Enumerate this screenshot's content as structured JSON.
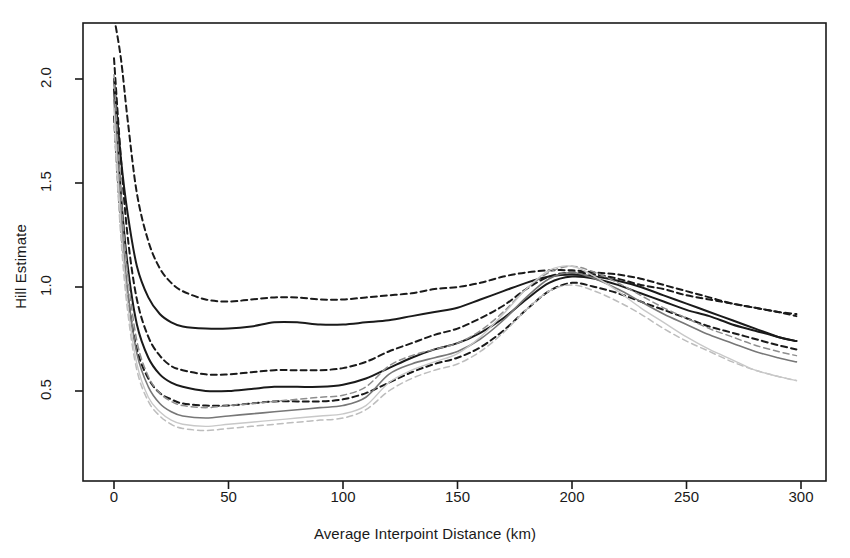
{
  "figure": {
    "top_title_fragment": "",
    "background": "#ffffff"
  },
  "axes": {
    "x_title": "Average Interpoint Distance (km)",
    "y_title": "Hill Estimate",
    "x_ticks": [
      "0",
      "50",
      "100",
      "150",
      "200",
      "250",
      "300"
    ],
    "y_ticks": [
      "0.5",
      "1.0",
      "1.5",
      "2.0"
    ],
    "frame_color": "#1a1a1a"
  },
  "colors": {
    "dark": "#1a1a1a",
    "mid": "#555555",
    "gray": "#a8a8a8",
    "light_gray": "#c0c0c0"
  },
  "chart_data": {
    "type": "line",
    "title": "",
    "xlabel": "Average Interpoint Distance (km)",
    "ylabel": "Hill Estimate",
    "xlim": [
      -5,
      305
    ],
    "ylim": [
      0.22,
      2.18
    ],
    "xticks": [
      0,
      50,
      100,
      150,
      200,
      250,
      300
    ],
    "yticks": [
      0.5,
      1.0,
      1.5,
      2.0
    ],
    "grid": false,
    "legend": "none",
    "x": [
      0,
      3,
      6,
      10,
      15,
      20,
      25,
      30,
      40,
      50,
      60,
      70,
      80,
      90,
      100,
      110,
      120,
      130,
      140,
      150,
      160,
      170,
      180,
      190,
      200,
      210,
      220,
      230,
      240,
      250,
      260,
      270,
      280,
      290,
      298
    ],
    "series": [
      {
        "name": "Estimate 1 (upper, solid, dark)",
        "style": "solid",
        "color": "#1a1a1a",
        "width": 2.0,
        "values": [
          2.0,
          1.62,
          1.35,
          1.1,
          0.95,
          0.87,
          0.83,
          0.81,
          0.8,
          0.8,
          0.81,
          0.83,
          0.83,
          0.82,
          0.82,
          0.83,
          0.84,
          0.86,
          0.88,
          0.9,
          0.94,
          0.98,
          1.02,
          1.05,
          1.06,
          1.05,
          1.03,
          1.0,
          0.96,
          0.92,
          0.88,
          0.84,
          0.8,
          0.76,
          0.74
        ]
      },
      {
        "name": "Estimate 1 upper CI (dashed, dark)",
        "style": "dashed",
        "color": "#1a1a1a",
        "width": 2.0,
        "values": [
          2.3,
          2.1,
          1.8,
          1.45,
          1.22,
          1.09,
          1.02,
          0.98,
          0.94,
          0.93,
          0.94,
          0.95,
          0.95,
          0.94,
          0.94,
          0.95,
          0.96,
          0.97,
          0.99,
          1.0,
          1.02,
          1.05,
          1.07,
          1.08,
          1.08,
          1.07,
          1.06,
          1.04,
          1.01,
          0.98,
          0.95,
          0.92,
          0.9,
          0.88,
          0.86
        ]
      },
      {
        "name": "Estimate 2 (middle, solid, dark)",
        "style": "solid",
        "color": "#1a1a1a",
        "width": 2.0,
        "values": [
          1.95,
          1.45,
          1.1,
          0.82,
          0.66,
          0.58,
          0.54,
          0.52,
          0.5,
          0.5,
          0.51,
          0.52,
          0.52,
          0.52,
          0.53,
          0.56,
          0.61,
          0.66,
          0.7,
          0.73,
          0.78,
          0.85,
          0.94,
          1.02,
          1.05,
          1.04,
          1.01,
          0.97,
          0.93,
          0.89,
          0.86,
          0.82,
          0.79,
          0.76,
          0.74
        ]
      },
      {
        "name": "Estimate 2 upper CI (dashed, dark)",
        "style": "dashed",
        "color": "#1a1a1a",
        "width": 2.0,
        "values": [
          2.1,
          1.62,
          1.24,
          0.94,
          0.76,
          0.67,
          0.62,
          0.6,
          0.58,
          0.58,
          0.59,
          0.6,
          0.6,
          0.6,
          0.61,
          0.64,
          0.69,
          0.73,
          0.77,
          0.8,
          0.85,
          0.91,
          0.99,
          1.05,
          1.07,
          1.06,
          1.04,
          1.01,
          0.99,
          0.96,
          0.94,
          0.92,
          0.9,
          0.88,
          0.87
        ]
      },
      {
        "name": "Estimate 2 lower CI (dashed, dark)",
        "style": "dashed",
        "color": "#1a1a1a",
        "width": 2.0,
        "values": [
          1.82,
          1.3,
          0.96,
          0.7,
          0.56,
          0.49,
          0.46,
          0.44,
          0.43,
          0.43,
          0.44,
          0.45,
          0.45,
          0.45,
          0.46,
          0.49,
          0.54,
          0.59,
          0.63,
          0.66,
          0.71,
          0.79,
          0.89,
          0.98,
          1.02,
          1.0,
          0.97,
          0.93,
          0.89,
          0.85,
          0.81,
          0.78,
          0.75,
          0.72,
          0.7
        ]
      },
      {
        "name": "Estimate 3 (lower, solid, gray)",
        "style": "solid",
        "color": "#777777",
        "width": 1.6,
        "values": [
          1.9,
          1.35,
          0.98,
          0.68,
          0.52,
          0.44,
          0.4,
          0.38,
          0.37,
          0.38,
          0.39,
          0.4,
          0.41,
          0.42,
          0.43,
          0.47,
          0.58,
          0.63,
          0.66,
          0.69,
          0.75,
          0.84,
          0.95,
          1.04,
          1.07,
          1.04,
          0.99,
          0.93,
          0.87,
          0.82,
          0.77,
          0.73,
          0.69,
          0.66,
          0.64
        ]
      },
      {
        "name": "Estimate 3 upper CI (dashed, gray)",
        "style": "dashed",
        "color": "#8e8e8e",
        "width": 1.5,
        "values": [
          2.02,
          1.45,
          1.06,
          0.74,
          0.57,
          0.49,
          0.45,
          0.43,
          0.42,
          0.43,
          0.44,
          0.45,
          0.46,
          0.47,
          0.48,
          0.52,
          0.62,
          0.67,
          0.7,
          0.73,
          0.79,
          0.88,
          0.99,
          1.07,
          1.1,
          1.07,
          1.02,
          0.96,
          0.9,
          0.85,
          0.8,
          0.76,
          0.72,
          0.69,
          0.67
        ]
      },
      {
        "name": "Estimate 3 lower CI (dashed, light gray)",
        "style": "dashed",
        "color": "#bdbdbd",
        "width": 1.5,
        "values": [
          1.78,
          1.24,
          0.88,
          0.6,
          0.45,
          0.38,
          0.34,
          0.32,
          0.31,
          0.32,
          0.33,
          0.34,
          0.35,
          0.36,
          0.37,
          0.41,
          0.5,
          0.56,
          0.6,
          0.63,
          0.69,
          0.78,
          0.89,
          0.98,
          1.01,
          0.98,
          0.93,
          0.87,
          0.8,
          0.74,
          0.69,
          0.64,
          0.6,
          0.57,
          0.55
        ]
      },
      {
        "name": "Estimate 4 lower (solid, light gray)",
        "style": "solid",
        "color": "#c8c8c8",
        "width": 1.4,
        "values": [
          1.86,
          1.3,
          0.92,
          0.63,
          0.47,
          0.4,
          0.36,
          0.34,
          0.33,
          0.34,
          0.35,
          0.36,
          0.37,
          0.38,
          0.39,
          0.43,
          0.54,
          0.6,
          0.64,
          0.68,
          0.76,
          0.87,
          0.99,
          1.08,
          1.1,
          1.05,
          0.98,
          0.9,
          0.83,
          0.76,
          0.7,
          0.65,
          0.6,
          0.57,
          0.55
        ]
      }
    ]
  }
}
